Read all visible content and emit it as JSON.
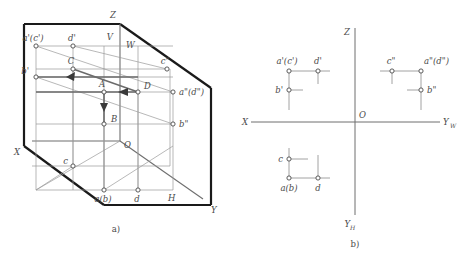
{
  "figure": {
    "captions": {
      "left": "a)",
      "right": "b)"
    },
    "colors": {
      "thick_edge": "#1a1a1a",
      "thin_line": "#8c8c8c",
      "projector_line": "#9a9a9a",
      "text": "#4a4a4a",
      "background": "#ffffff",
      "marker_fill": "#ffffff"
    }
  },
  "axonometric": {
    "name": "a",
    "caption": "a)",
    "plane_labels": {
      "v": "V",
      "w": "W",
      "h": "H"
    },
    "axis_labels": {
      "z": "Z",
      "x": "X",
      "y": "Y",
      "origin": "O"
    },
    "space_points": [
      {
        "id": "A",
        "label": "A"
      },
      {
        "id": "B",
        "label": "B"
      },
      {
        "id": "C",
        "label": "C"
      },
      {
        "id": "D",
        "label": "D"
      }
    ],
    "v_projections": [
      {
        "id": "ac_v",
        "label": "a'(c')"
      },
      {
        "id": "d_v",
        "label": "d'"
      },
      {
        "id": "b_v",
        "label": "b'"
      }
    ],
    "w_projections": [
      {
        "id": "c_w",
        "label": "c\""
      },
      {
        "id": "ad_w",
        "label": "a\"(d\")"
      },
      {
        "id": "b_w",
        "label": "b\""
      }
    ],
    "h_projections": [
      {
        "id": "c_h",
        "label": "c"
      },
      {
        "id": "ab_h",
        "label": "a(b)"
      },
      {
        "id": "d_h",
        "label": "d"
      }
    ]
  },
  "orthographic": {
    "name": "b",
    "caption": "b)",
    "axis_labels": {
      "z": "Z",
      "x": "X",
      "origin": "O",
      "y_w": "Y",
      "y_w_sub": "W",
      "y_h": "Y",
      "y_h_sub": "H"
    },
    "v_quadrant": [
      {
        "id": "ac_v",
        "label": "a'(c')"
      },
      {
        "id": "d_v",
        "label": "d'"
      },
      {
        "id": "b_v",
        "label": "b'"
      }
    ],
    "w_quadrant": [
      {
        "id": "c_w",
        "label": "c\""
      },
      {
        "id": "ad_w",
        "label": "a\"(d\")"
      },
      {
        "id": "b_w",
        "label": "b\""
      }
    ],
    "h_quadrant": [
      {
        "id": "c_h",
        "label": "c"
      },
      {
        "id": "ab_h",
        "label": "a(b)"
      },
      {
        "id": "d_h",
        "label": "d"
      }
    ]
  }
}
